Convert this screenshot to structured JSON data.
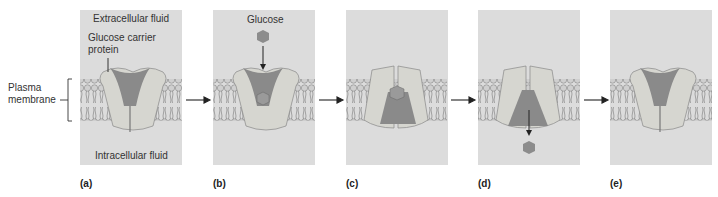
{
  "labels": {
    "extracellular": "Extracellular fluid",
    "carrier_line1": "Glucose carrier",
    "carrier_line2": "protein",
    "plasma_line1": "Plasma",
    "plasma_line2": "membrane",
    "intracellular": "Intracellular fluid",
    "glucose": "Glucose"
  },
  "panels": [
    {
      "caption": "(a)",
      "x": 80
    },
    {
      "caption": "(b)",
      "x": 213
    },
    {
      "caption": "(c)",
      "x": 346
    },
    {
      "caption": "(d)",
      "x": 478
    },
    {
      "caption": "(e)",
      "x": 610
    }
  ],
  "colors": {
    "background": "#dcdcdc",
    "protein": "#d6d6d0",
    "channel": "#8a8a8a",
    "glucose": "#8c8c8c",
    "lipid_head": "#c8c8c8"
  }
}
